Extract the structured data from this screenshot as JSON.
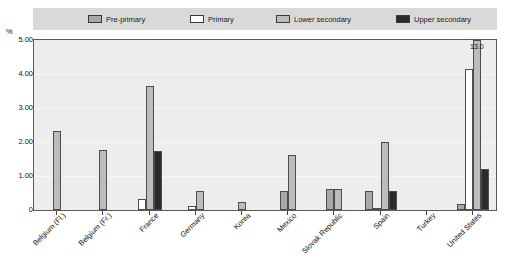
{
  "chart_data": {
    "type": "bar",
    "title": "",
    "xlabel": "",
    "ylabel": "%",
    "ylim": [
      0,
      5.0
    ],
    "ytick_labels": [
      "0",
      "1.00",
      "2.00",
      "3.00",
      "4.00",
      "5.00"
    ],
    "ytick_values": [
      0,
      1.0,
      2.0,
      3.0,
      4.0,
      5.0
    ],
    "grid": true,
    "legend_position": "top",
    "categories": [
      "Belgium (Fl.)",
      "Belgium (Fr.)",
      "France",
      "Germany",
      "Korea",
      "Mexico",
      "Slovak Republic",
      "Spain",
      "Turkey",
      "United States"
    ],
    "series": [
      {
        "name": "Pre-primary",
        "color": "#a8a8a8",
        "values": [
          null,
          null,
          null,
          null,
          null,
          0.55,
          0.63,
          0.57,
          null,
          0.18
        ]
      },
      {
        "name": "Primary",
        "color": "#ffffff",
        "values": [
          null,
          null,
          0.32,
          0.12,
          null,
          null,
          null,
          0.06,
          null,
          4.15
        ]
      },
      {
        "name": "Lower secondary",
        "color": "#bcbcbc",
        "values": [
          2.33,
          1.77,
          3.66,
          0.55,
          0.25,
          1.62,
          0.62,
          2.0,
          null,
          13.0
        ]
      },
      {
        "name": "Upper secondary",
        "color": "#2b2b2b",
        "values": [
          null,
          null,
          1.74,
          null,
          null,
          null,
          null,
          0.55,
          null,
          1.22
        ]
      }
    ],
    "annotations": [
      {
        "text": "13.0",
        "category": "United States",
        "series": "Lower secondary",
        "note": "value exceeds axis maximum, bar clipped"
      }
    ]
  },
  "legend": {
    "items": [
      {
        "label": "Pre-primary",
        "color": "#a8a8a8"
      },
      {
        "label": "Primary",
        "color": "#ffffff"
      },
      {
        "label": "Lower secondary",
        "color": "#bcbcbc"
      },
      {
        "label": "Upper secondary",
        "color": "#2b2b2b"
      }
    ]
  },
  "axis": {
    "unit_label": "%"
  }
}
